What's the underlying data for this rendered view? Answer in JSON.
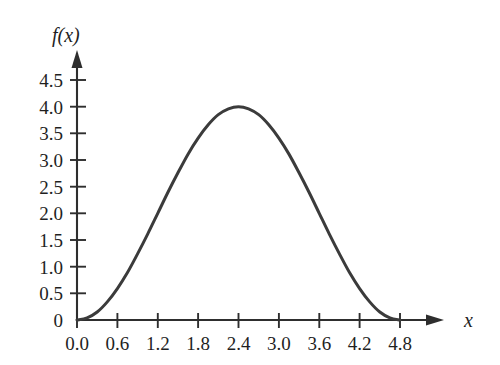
{
  "chart_data": {
    "type": "line",
    "title": "",
    "subtitle": "",
    "xlabel": "x",
    "ylabel": "f(x)",
    "xlim": [
      0.0,
      4.8
    ],
    "ylim": [
      0.0,
      4.5
    ],
    "grid": false,
    "legend": null,
    "annotations": [],
    "x_tick_labels": [
      "0.0",
      "0.6",
      "1.2",
      "1.8",
      "2.4",
      "3.0",
      "3.6",
      "4.2",
      "4.8"
    ],
    "x_tick_values": [
      0.0,
      0.6,
      1.2,
      1.8,
      2.4,
      3.0,
      3.6,
      4.2,
      4.8
    ],
    "y_tick_labels": [
      "0",
      "0.5",
      "1.0",
      "1.5",
      "2.0",
      "2.5",
      "3.0",
      "3.5",
      "4.0",
      "4.5"
    ],
    "y_tick_values": [
      0.0,
      0.5,
      1.0,
      1.5,
      2.0,
      2.5,
      3.0,
      3.5,
      4.0,
      4.5
    ],
    "series": [
      {
        "name": "f(x)",
        "color": "#3b3b3b",
        "x": [
          0.0,
          0.15,
          0.3,
          0.45,
          0.6,
          0.75,
          0.9,
          1.05,
          1.2,
          1.35,
          1.5,
          1.65,
          1.8,
          1.95,
          2.1,
          2.25,
          2.4,
          2.55,
          2.7,
          2.85,
          3.0,
          3.15,
          3.3,
          3.45,
          3.6,
          3.75,
          3.9,
          4.05,
          4.2,
          4.35,
          4.5,
          4.65,
          4.8
        ],
        "values": [
          0.0,
          0.04,
          0.15,
          0.34,
          0.59,
          0.89,
          1.24,
          1.61,
          2.0,
          2.39,
          2.76,
          3.11,
          3.41,
          3.66,
          3.85,
          3.96,
          4.0,
          3.96,
          3.85,
          3.66,
          3.41,
          3.11,
          2.76,
          2.39,
          2.0,
          1.61,
          1.24,
          0.89,
          0.59,
          0.34,
          0.15,
          0.04,
          0.0
        ]
      }
    ],
    "peak": {
      "x": 2.4,
      "y": 4.0
    },
    "zeros": [
      0.0,
      4.8
    ]
  },
  "axis_titles": {
    "y": "f(x)",
    "x": "x"
  }
}
